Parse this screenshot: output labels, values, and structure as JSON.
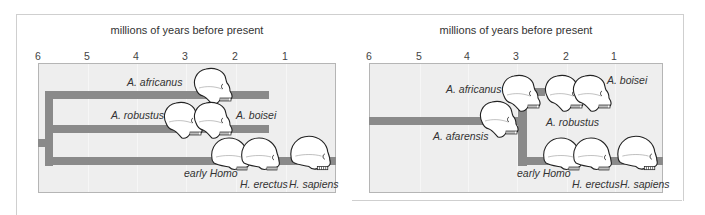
{
  "left_panel": {
    "axis_title": "millions of years before present",
    "ticks": [
      "6",
      "5",
      "4",
      "3",
      "2",
      "1"
    ],
    "labels": {
      "africanus": "A. africanus",
      "robustus": "A. robustus",
      "boisei": "A. boisei",
      "early_homo": "early Homo",
      "erectus": "H. erectus",
      "sapiens": "H. sapiens"
    }
  },
  "right_panel": {
    "axis_title": "millions of years before present",
    "ticks": [
      "6",
      "5",
      "4",
      "3",
      "2",
      "1"
    ],
    "labels": {
      "africanus": "A. africanus",
      "boisei": "A. boisei",
      "afarensis": "A. afarensis",
      "robustus": "A. robustus",
      "early_homo": "early Homo",
      "erectus": "H. erectus",
      "sapiens": "H. sapiens"
    }
  },
  "colors": {
    "bar": "#8a8a8a",
    "plot_bg": "#eeeeee",
    "skull_fill": "#ffffff",
    "skull_stroke": "#222222"
  }
}
